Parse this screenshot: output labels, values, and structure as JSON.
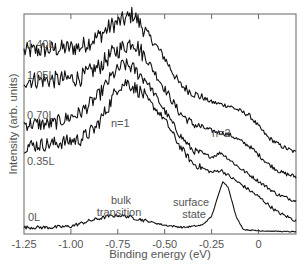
{
  "chart_data": {
    "type": "line",
    "title": "",
    "xlabel": "Binding energy (eV)",
    "ylabel": "Intensity (arb. units)",
    "xlim": [
      -1.25,
      0.2
    ],
    "xticks": [
      -1.25,
      -1.0,
      -0.75,
      -0.5,
      -0.25,
      0
    ],
    "xtick_labels": [
      "-1.25",
      "-1.00",
      "-0.75",
      "-0.50",
      "-0.25",
      "0"
    ],
    "grid": false,
    "legend": "inline labels at left",
    "series": [
      {
        "name": "1.40L",
        "x": [
          -1.25,
          -1.1,
          -0.95,
          -0.85,
          -0.78,
          -0.7,
          -0.67,
          -0.6,
          -0.5,
          -0.42,
          -0.35,
          -0.25,
          -0.15,
          -0.05,
          0.05,
          0.12,
          0.2
        ],
        "y": [
          0.83,
          0.84,
          0.85,
          0.9,
          0.95,
          0.98,
          1.0,
          0.92,
          0.8,
          0.68,
          0.64,
          0.6,
          0.58,
          0.54,
          0.44,
          0.4,
          0.37
        ],
        "noise": 0.025
      },
      {
        "name": "1.05L",
        "x": [
          -1.25,
          -1.1,
          -0.95,
          -0.85,
          -0.78,
          -0.7,
          -0.67,
          -0.6,
          -0.5,
          -0.42,
          -0.35,
          -0.25,
          -0.15,
          -0.05,
          0.05,
          0.12,
          0.2
        ],
        "y": [
          0.7,
          0.7,
          0.71,
          0.76,
          0.82,
          0.86,
          0.88,
          0.8,
          0.66,
          0.55,
          0.5,
          0.47,
          0.45,
          0.4,
          0.32,
          0.28,
          0.26
        ],
        "noise": 0.025
      },
      {
        "name": "0.70L",
        "x": [
          -1.25,
          -1.1,
          -0.95,
          -0.85,
          -0.78,
          -0.72,
          -0.68,
          -0.6,
          -0.5,
          -0.42,
          -0.35,
          -0.25,
          -0.2,
          -0.1,
          0.0,
          0.1,
          0.2
        ],
        "y": [
          0.5,
          0.5,
          0.55,
          0.63,
          0.72,
          0.77,
          0.76,
          0.7,
          0.56,
          0.45,
          0.38,
          0.35,
          0.37,
          0.3,
          0.24,
          0.18,
          0.15
        ],
        "noise": 0.02
      },
      {
        "name": "0.35L",
        "x": [
          -1.25,
          -1.1,
          -0.95,
          -0.87,
          -0.8,
          -0.75,
          -0.7,
          -0.62,
          -0.5,
          -0.42,
          -0.35,
          -0.25,
          -0.2,
          -0.1,
          0.0,
          0.1,
          0.2
        ],
        "y": [
          0.4,
          0.41,
          0.43,
          0.48,
          0.58,
          0.67,
          0.69,
          0.64,
          0.52,
          0.4,
          0.32,
          0.28,
          0.29,
          0.23,
          0.17,
          0.1,
          0.06
        ],
        "noise": 0.02
      },
      {
        "name": "0L",
        "x": [
          -1.25,
          -1.1,
          -1.0,
          -0.9,
          -0.8,
          -0.75,
          -0.7,
          -0.6,
          -0.5,
          -0.4,
          -0.3,
          -0.25,
          -0.22,
          -0.19,
          -0.16,
          -0.12,
          -0.08,
          0.0,
          0.1,
          0.2
        ],
        "y": [
          0.03,
          0.03,
          0.035,
          0.06,
          0.08,
          0.085,
          0.08,
          0.06,
          0.04,
          0.03,
          0.04,
          0.08,
          0.16,
          0.24,
          0.21,
          0.08,
          0.02,
          0.015,
          0.012,
          0.01
        ],
        "noise": 0.005
      }
    ],
    "annotations": [
      {
        "text": "n=1",
        "x": -0.68,
        "note": "first image-potential state"
      },
      {
        "text": "n=2",
        "x": -0.17
      },
      {
        "text": "bulk\ntransition",
        "x": -0.76
      },
      {
        "text": "surface\nstate",
        "x": -0.28
      }
    ]
  },
  "labels": {
    "s140": "1.40L",
    "s105": "1.05L",
    "s070": "0.70L",
    "s035": "0.35L",
    "s0": "0L",
    "n1": "n=1",
    "n2": "n=2",
    "bulk1": "bulk",
    "bulk2": "transition",
    "surf1": "surface",
    "surf2": "state"
  }
}
